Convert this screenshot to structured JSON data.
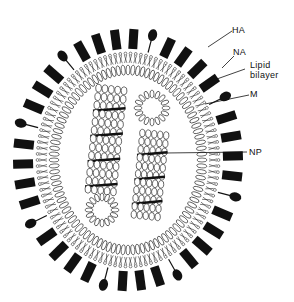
{
  "diagram": {
    "type": "influenza virus particle cross-section",
    "labels": {
      "ha": "HA",
      "na": "NA",
      "lipid_line1": "Lipid",
      "lipid_line2": "bilayer",
      "m": "M",
      "np": "NP"
    },
    "components": [
      {
        "id": "HA",
        "description": "hemagglutinin spikes (black rectangles)"
      },
      {
        "id": "NA",
        "description": "neuraminidase spikes (stalk with oval head)"
      },
      {
        "id": "lipid-bilayer",
        "description": "outer double row of lipid molecules"
      },
      {
        "id": "M",
        "description": "matrix protein layer"
      },
      {
        "id": "NP",
        "description": "nucleoprotein helical coils (two RNP segments)"
      }
    ],
    "colors": {
      "ink": "#111111",
      "background": "#ffffff"
    }
  }
}
